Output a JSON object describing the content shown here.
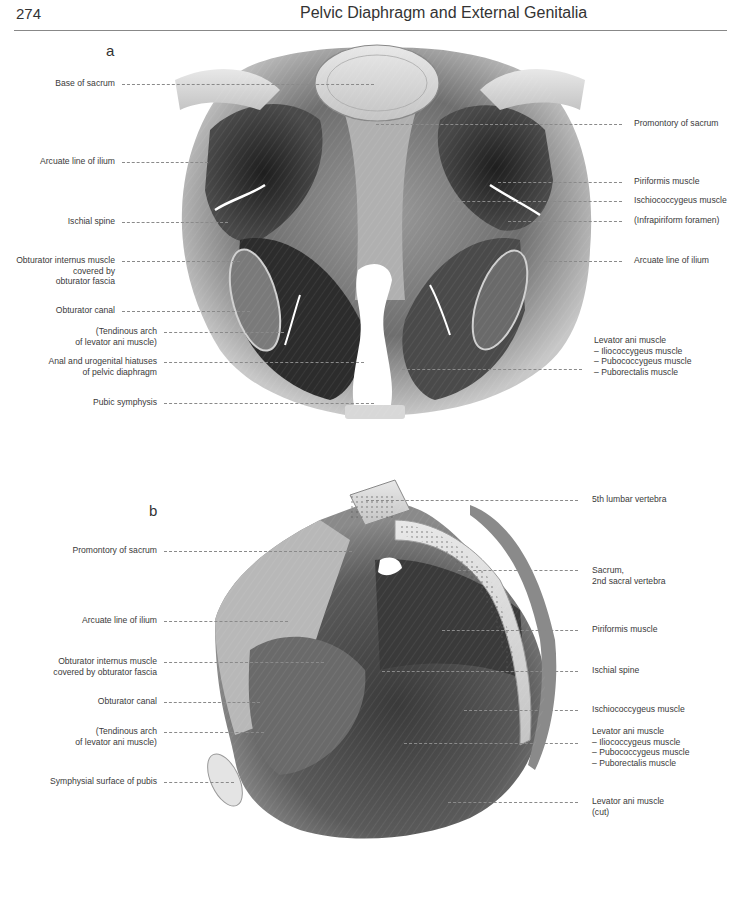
{
  "header": {
    "page_number": "274",
    "running_title": "Pelvic Diaphragm and External Genitalia"
  },
  "figure_a": {
    "letter": "a",
    "left_labels": [
      {
        "text": "Base of sacrum"
      },
      {
        "text": "Arcuate line of ilium"
      },
      {
        "text": "Ischial spine"
      },
      {
        "text": "Obturator internus muscle\ncovered by\nobturator fascia"
      },
      {
        "text": "Obturator canal"
      },
      {
        "text": "(Tendinous arch\nof levator ani muscle)"
      },
      {
        "text": "Anal and urogenital hiatuses\nof pelvic diaphragm"
      },
      {
        "text": "Pubic symphysis"
      }
    ],
    "right_labels": [
      {
        "text": "Promontory of sacrum"
      },
      {
        "text": "Piriformis muscle"
      },
      {
        "text": "Ischiococcygeus muscle"
      },
      {
        "text": "(Infrapiriform foramen)"
      },
      {
        "text": "Arcuate line of ilium"
      },
      {
        "text": "Levator ani muscle\n– Iliococcygeus muscle\n– Pubococcygeus muscle\n– Puborectalis muscle"
      }
    ]
  },
  "figure_b": {
    "letter": "b",
    "left_labels": [
      {
        "text": "Promontory of sacrum"
      },
      {
        "text": "Arcuate line of ilium"
      },
      {
        "text": "Obturator internus muscle\ncovered by obturator fascia"
      },
      {
        "text": "Obturator canal"
      },
      {
        "text": "(Tendinous arch\nof levator ani muscle)"
      },
      {
        "text": "Symphysial surface of pubis"
      }
    ],
    "right_labels": [
      {
        "text": "5th lumbar vertebra"
      },
      {
        "text": "Sacrum,\n2nd sacral vertebra"
      },
      {
        "text": "Piriformis muscle"
      },
      {
        "text": "Ischial spine"
      },
      {
        "text": "Ischiococcygeus muscle"
      },
      {
        "text": "Levator ani muscle\n– Iliococcygeus muscle\n– Pubococcygeus muscle\n– Puborectalis muscle"
      },
      {
        "text": "Levator ani muscle\n(cut)"
      }
    ]
  }
}
